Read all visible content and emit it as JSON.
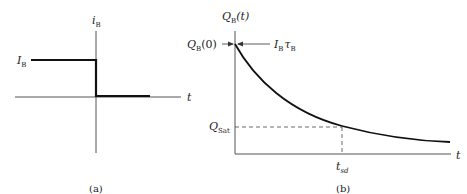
{
  "figure_a": {
    "caption": "(a)",
    "y_axis_label": "i",
    "y_axis_label_sub": "B",
    "x_axis_label": "t",
    "level_label": "I",
    "level_label_sub": "B",
    "description": "Base current step: constant I_B for t<0, drops to zero at t=0"
  },
  "figure_b": {
    "caption": "(b)",
    "y_axis_label": "Q",
    "y_axis_label_sub": "B",
    "y_axis_label_arg": "(t)",
    "x_axis_label": "t",
    "initial_label": "Q",
    "initial_label_sub": "B",
    "initial_label_arg": "(0)",
    "initial_value_label": "I",
    "initial_value_label_sub": "B",
    "initial_value_tau": "τ",
    "initial_value_tau_sub": "B",
    "threshold_label": "Q",
    "threshold_label_sub": "Sat",
    "time_marker_label": "t",
    "time_marker_label_sub": "sd",
    "description": "Stored base charge decays exponentially from I_B·τ_B; reaches Q_Sat at t_sd"
  },
  "colors": {
    "ink": "#222222",
    "axis": "#555555",
    "background": "#ffffff"
  }
}
